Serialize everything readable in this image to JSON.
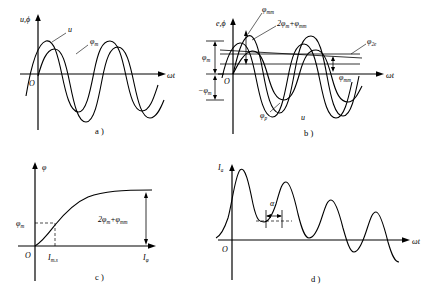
{
  "figure": {
    "background": "#ffffff",
    "stroke_color": "#000000",
    "panels": [
      {
        "id": "a",
        "caption": "a )",
        "y_axis_label": "u,ϕ",
        "x_axis_label": "ωt",
        "origin_label": "O",
        "curve_labels": [
          {
            "name": "voltage-curve-label",
            "text": "u"
          },
          {
            "name": "flux-curve-label",
            "text": "φ",
            "sub": "m"
          }
        ]
      },
      {
        "id": "b",
        "caption": "b )",
        "y_axis_label": "e,ϕ",
        "x_axis_label": "ωt",
        "origin_label": "O",
        "curve_labels": [
          {
            "name": "residual-flux-label",
            "text": "φ",
            "sub": "mm"
          },
          {
            "name": "peak-flux-sum-label",
            "text": "2φ",
            "sub": "m",
            "text2": "+φ",
            "sub2": "mm"
          },
          {
            "name": "secondary-flux-label",
            "text": "φ",
            "sub": "2e"
          },
          {
            "name": "residual-flux-axis-label",
            "text": "φ",
            "sub": "mm"
          },
          {
            "name": "periodic-flux-label",
            "text": "φ",
            "sub": "p"
          },
          {
            "name": "voltage-curve-label",
            "text": "u"
          }
        ],
        "y_markers": [
          {
            "name": "positive-flux-marker",
            "text": "φ",
            "sub": "m"
          },
          {
            "name": "negative-flux-marker",
            "text": "−φ",
            "sub": "m"
          }
        ]
      },
      {
        "id": "c",
        "caption": "c )",
        "y_axis_label": "φ",
        "x_axis_label": "I",
        "x_axis_sub": "φ",
        "origin_label": "O",
        "y_tick_label": {
          "text": "φ",
          "sub": "m"
        },
        "x_tick_label": {
          "text": "I",
          "sub": "m.s"
        },
        "annotation": {
          "text": "2φ",
          "sub": "m",
          "text2": "+φ",
          "sub2": "mm"
        }
      },
      {
        "id": "d",
        "caption": "d )",
        "y_axis_label": "I",
        "y_axis_sub": "a",
        "x_axis_label": "ωt",
        "origin_label": "O",
        "angle_label": "α"
      }
    ]
  }
}
